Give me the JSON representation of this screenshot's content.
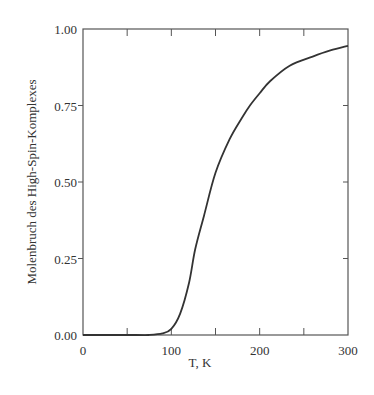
{
  "chart_data": {
    "type": "line",
    "title": "",
    "xlabel": "T, K",
    "ylabel": "Molenbruch des High-Spin-Komplexes",
    "xlim": [
      0,
      300
    ],
    "ylim": [
      0,
      1
    ],
    "x_ticks": [
      "0",
      "100",
      "200",
      "300"
    ],
    "y_ticks": [
      "0.00",
      "0.25",
      "0.50",
      "0.75",
      "1.00"
    ],
    "grid": false,
    "legend": null,
    "series": [
      {
        "name": "High-Spin fraction",
        "x": [
          0,
          60,
          74,
          90,
          100,
          110,
          120,
          127,
          137,
          150,
          166,
          180,
          189,
          200,
          212,
          234,
          260,
          280,
          300
        ],
        "values": [
          0.0,
          0.0,
          0.0,
          0.005,
          0.02,
          0.07,
          0.17,
          0.28,
          0.39,
          0.53,
          0.64,
          0.71,
          0.75,
          0.79,
          0.83,
          0.88,
          0.91,
          0.93,
          0.945
        ]
      }
    ]
  }
}
